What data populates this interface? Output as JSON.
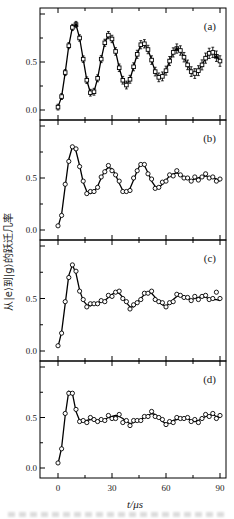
{
  "figure": {
    "x_axis": {
      "label": "t/μs",
      "ticks": [
        0,
        30,
        60,
        90
      ],
      "tick_labels": [
        "0",
        "30",
        "60",
        "90"
      ],
      "minor_ticks": [
        15,
        45,
        75
      ],
      "range": [
        -10,
        93.3
      ]
    },
    "y_axis": {
      "label": "从|e⟩到|g⟩的跃迁几率",
      "ticks": [
        0,
        0.5,
        1
      ],
      "labeled_ticks": [
        [
          0.0,
          "0.0"
        ],
        [
          0.5,
          "0.5"
        ]
      ],
      "minor_ticks": [
        0.25,
        0.75
      ],
      "range": [
        0,
        1
      ]
    },
    "colors": {
      "ink": "#000000",
      "background": "#ffffff"
    }
  },
  "chart_data": {
    "type": "line",
    "x_start": 0,
    "x_step": 2,
    "panels": [
      {
        "label": "(a)",
        "marker": "square",
        "has_error_bars": true,
        "error_bar_min": 0.03,
        "error_bar_max": 0.055,
        "curve": [
          0.03,
          0.14,
          0.39,
          0.67,
          0.86,
          0.89,
          0.75,
          0.53,
          0.31,
          0.18,
          0.19,
          0.33,
          0.53,
          0.7,
          0.78,
          0.74,
          0.61,
          0.44,
          0.31,
          0.26,
          0.32,
          0.45,
          0.58,
          0.68,
          0.69,
          0.63,
          0.52,
          0.4,
          0.34,
          0.35,
          0.41,
          0.51,
          0.6,
          0.64,
          0.62,
          0.55,
          0.47,
          0.4,
          0.38,
          0.41,
          0.47,
          0.54,
          0.59,
          0.6,
          0.56,
          0.51
        ],
        "filled_triangle_points": [
          [
            10,
            0.89
          ],
          [
            66,
            0.64
          ],
          [
            88,
            0.56
          ]
        ]
      },
      {
        "label": "(b)",
        "marker": "circle",
        "has_error_bars": false,
        "curve": [
          0.03,
          0.15,
          0.42,
          0.68,
          0.8,
          0.76,
          0.62,
          0.46,
          0.37,
          0.35,
          0.37,
          0.42,
          0.5,
          0.57,
          0.6,
          0.59,
          0.53,
          0.45,
          0.38,
          0.36,
          0.4,
          0.48,
          0.57,
          0.64,
          0.62,
          0.55,
          0.47,
          0.42,
          0.41,
          0.44,
          0.48,
          0.52,
          0.54,
          0.55,
          0.53,
          0.51,
          0.49,
          0.48,
          0.49,
          0.5,
          0.51,
          0.52,
          0.51,
          0.5,
          0.49,
          0.47
        ],
        "points": [
          0.04,
          0.14,
          0.44,
          0.66,
          0.8,
          0.78,
          0.61,
          0.47,
          0.35,
          0.37,
          0.37,
          0.41,
          0.51,
          0.56,
          0.62,
          0.57,
          0.53,
          0.47,
          0.37,
          0.37,
          0.38,
          0.5,
          0.57,
          0.63,
          0.63,
          0.54,
          0.49,
          0.4,
          0.41,
          0.46,
          0.47,
          0.53,
          0.52,
          0.57,
          0.53,
          0.5,
          0.5,
          0.47,
          0.51,
          0.48,
          0.51,
          0.54,
          0.5,
          0.51,
          0.47,
          0.49
        ]
      },
      {
        "label": "(c)",
        "marker": "circle",
        "has_error_bars": false,
        "curve": [
          0.04,
          0.18,
          0.45,
          0.72,
          0.82,
          0.74,
          0.58,
          0.48,
          0.44,
          0.43,
          0.45,
          0.46,
          0.47,
          0.48,
          0.51,
          0.54,
          0.56,
          0.55,
          0.51,
          0.46,
          0.42,
          0.42,
          0.46,
          0.5,
          0.54,
          0.56,
          0.55,
          0.51,
          0.47,
          0.44,
          0.43,
          0.45,
          0.49,
          0.52,
          0.53,
          0.52,
          0.5,
          0.49,
          0.5,
          0.51,
          0.52,
          0.51,
          0.5,
          0.49,
          0.49,
          0.48
        ],
        "points": [
          0.05,
          0.17,
          0.47,
          0.7,
          0.82,
          0.76,
          0.57,
          0.49,
          0.42,
          0.45,
          0.45,
          0.45,
          0.48,
          0.47,
          0.53,
          0.52,
          0.56,
          0.57,
          0.5,
          0.47,
          0.4,
          0.44,
          0.46,
          0.49,
          0.55,
          0.55,
          0.57,
          0.49,
          0.47,
          0.46,
          0.42,
          0.46,
          0.47,
          0.54,
          0.53,
          0.51,
          0.51,
          0.48,
          0.52,
          0.49,
          0.52,
          0.53,
          0.49,
          0.5,
          0.56,
          0.5
        ]
      },
      {
        "label": "(d)",
        "marker": "circle",
        "has_error_bars": false,
        "curve": [
          0.04,
          0.2,
          0.52,
          0.76,
          0.74,
          0.56,
          0.47,
          0.46,
          0.47,
          0.48,
          0.48,
          0.47,
          0.47,
          0.48,
          0.5,
          0.51,
          0.52,
          0.51,
          0.49,
          0.46,
          0.44,
          0.45,
          0.47,
          0.48,
          0.5,
          0.52,
          0.54,
          0.53,
          0.5,
          0.46,
          0.44,
          0.45,
          0.47,
          0.48,
          0.49,
          0.5,
          0.49,
          0.47,
          0.46,
          0.47,
          0.49,
          0.51,
          0.52,
          0.53,
          0.51,
          0.5
        ],
        "points": [
          0.05,
          0.19,
          0.54,
          0.74,
          0.74,
          0.58,
          0.46,
          0.47,
          0.45,
          0.5,
          0.48,
          0.46,
          0.48,
          0.47,
          0.52,
          0.49,
          0.49,
          0.53,
          0.45,
          0.47,
          0.42,
          0.47,
          0.47,
          0.47,
          0.51,
          0.51,
          0.56,
          0.51,
          0.5,
          0.48,
          0.43,
          0.46,
          0.45,
          0.5,
          0.49,
          0.49,
          0.5,
          0.46,
          0.48,
          0.45,
          0.49,
          0.53,
          0.51,
          0.54,
          0.49,
          0.52
        ]
      }
    ]
  }
}
